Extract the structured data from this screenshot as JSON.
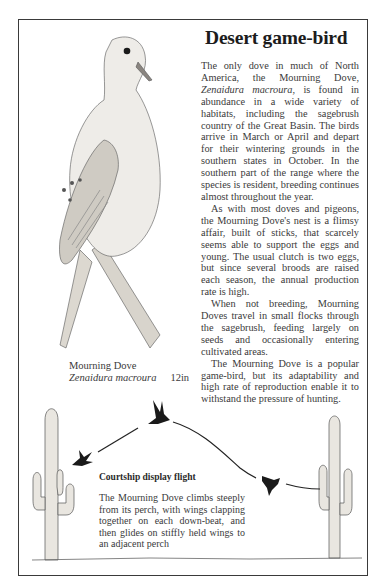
{
  "article": {
    "title": "Desert game-bird",
    "paragraphs": [
      {
        "before": "The only dove in much of North America, the Mourning Dove, ",
        "italic": "Zenaidura macroura",
        "after": ", is found in abundance in a wide variety of habitats, including the sagebrush country of the Great Basin. The birds arrive in March or April and depart for their wintering grounds in the southern states in October. In the southern part of the range where the species is resident, breeding continues almost throughout the year."
      },
      {
        "text": "As with most doves and pigeons, the Mourning Dove's nest is a flimsy affair, built of sticks, that scarcely seems able to support the eggs and young. The usual clutch is two eggs, but since several broods are raised each season, the annual production rate is high."
      },
      {
        "text": "When not breeding, Mourning Doves travel in small flocks through the sagebrush, feeding largely on seeds and occasionally entering cultivated areas."
      },
      {
        "text": "The Mourning Dove is a popular game-bird, but its adaptability and high rate of reproduction enable it to withstand the pressure of hunting."
      }
    ]
  },
  "illustration": {
    "common_name": "Mourning Dove",
    "scientific_name": "Zenaidura macroura",
    "size": "12in"
  },
  "courtship": {
    "title": "Courtship display flight",
    "text": "The Mourning Dove climbs steeply from its perch, with wings clapping together on each down-beat, and then glides on stiffly held wings to an adjacent perch"
  }
}
